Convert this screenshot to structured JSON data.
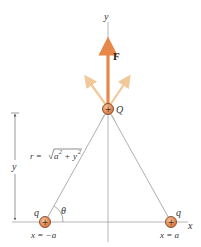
{
  "diagram": {
    "axes": {
      "x_label": "x",
      "y_label": "y"
    },
    "charges": {
      "center": {
        "symbol": "+",
        "label": "Q"
      },
      "left": {
        "symbol": "+",
        "label": "q",
        "position_label": "x = −a"
      },
      "right": {
        "symbol": "+",
        "label": "q",
        "position_label": "x = a"
      }
    },
    "force": {
      "label": "F"
    },
    "distance": {
      "r_prefix": "r = ",
      "r_expr_a": "a",
      "r_expr_plus": " + ",
      "r_expr_y": "y",
      "exponent": "2"
    },
    "angle": {
      "label": "θ"
    },
    "height_dimension": {
      "label": "y"
    },
    "colors": {
      "force_arrow": "#e8874a",
      "component_arrow": "#f2c89a",
      "charge_fill": "#e8914f",
      "charge_stroke": "#7a4a2a",
      "line": "#888888"
    }
  }
}
